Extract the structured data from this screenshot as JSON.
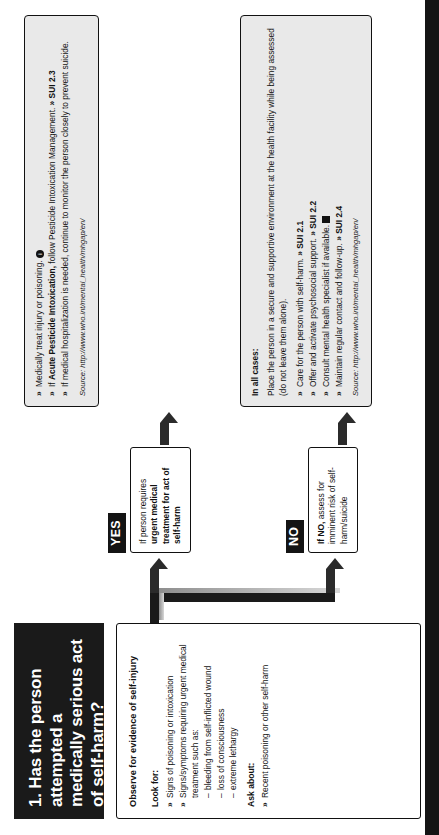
{
  "title": {
    "text": "1. Has the person attempted a medically serious act of self-harm?"
  },
  "assessment": {
    "heading": "Observe for evidence of self-injury",
    "look_for_label": "Look for:",
    "look_for": [
      "Signs of poisoning or intoxication",
      "Signs/symptoms requiring urgent medical treatment such as:"
    ],
    "look_for_sub": [
      "bleeding from self-inflicted wound",
      "loss of consciousness",
      "extreme lethargy"
    ],
    "ask_about_label": "Ask about:",
    "ask_about": [
      "Recent poisoning or other self-harm"
    ]
  },
  "branches": [
    {
      "chip": "YES",
      "condition_lead": "If person requires",
      "condition": "urgent medical treatment for act of self-harm"
    },
    {
      "chip": "NO",
      "condition_lead": "If NO,",
      "condition": "assess for imminent risk of self-harm/suicide"
    }
  ],
  "actions": {
    "yes_box": {
      "bullets": [
        {
          "pre": "Medically treat injury or poisoning.",
          "post": "",
          "ref": "",
          "icon": "info-icon"
        },
        {
          "pre": "If ",
          "bold": "Acute Pesticide Intoxication,",
          "post": " follow Pesticide Intoxication Management.",
          "ref": "» SUI 2.3"
        },
        {
          "pre": "If medical hospitalization is needed, continue to monitor the person closely to prevent suicide.",
          "post": "",
          "ref": ""
        }
      ],
      "source": "Source: http://www.who.int/mental_health/mhgap/en/"
    },
    "all_cases_box": {
      "heading": "In all cases:",
      "intro": "Place the person in a secure and supportive environment at the health facility while being assessed (do not leave them alone).",
      "bullets": [
        {
          "pre": "Care for the person with self-harm.",
          "ref": "» SUI 2.1"
        },
        {
          "pre": "Offer and activate psychosocial support.",
          "ref": "» SUI 2.2"
        },
        {
          "pre": "Consult mental health specialist if available.",
          "ref": "",
          "icon": "book-icon"
        },
        {
          "pre": "Maintain regular contact and follow-up.",
          "ref": "» SUI 2.4"
        }
      ],
      "source": "Source: http://www.who.int/mental_health/mhgap/en/"
    }
  },
  "colors": {
    "title_bg": "#1a1a1a",
    "grey_bg": "#e9e9e9",
    "line": "#111111",
    "chip_bg": "#141414"
  }
}
